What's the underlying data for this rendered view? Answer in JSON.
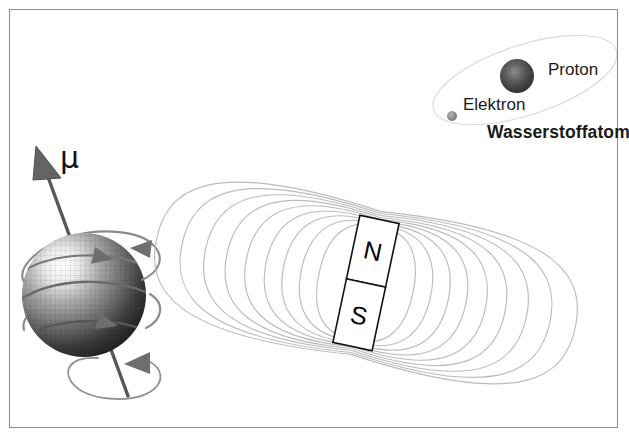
{
  "figure": {
    "background_color": "#ffffff",
    "border_color": "#8c8c8c",
    "width": 629,
    "height": 439
  },
  "hydrogen_atom": {
    "title": "Wasserstoffatom",
    "proton_label": "Proton",
    "electron_label": "Elektron",
    "proton_color": "#4a4a4a",
    "electron_color": "#8f8f8f",
    "orbit_color": "#d8d8d8",
    "proton": {
      "cx": 517,
      "cy": 76,
      "r": 17
    },
    "electron": {
      "cx": 452,
      "cy": 116,
      "r": 5
    },
    "orbit": {
      "cx": 525,
      "cy": 80,
      "rx": 95,
      "ry": 34,
      "rotation": -18
    }
  },
  "magnetic_moment": {
    "symbol": "μ",
    "sphere_color_light": "#ffffff",
    "sphere_color_dark": "#2b2b2b",
    "axis_color": "#5a5a5a",
    "spin_arrow_color": "#707070",
    "sphere": {
      "cx": 84,
      "cy": 295,
      "r": 62
    },
    "axis": {
      "x1": 42,
      "y1": 160,
      "x2": 128,
      "y2": 395
    },
    "precession_ellipse": {
      "cx": 113,
      "cy": 375,
      "rx": 48,
      "ry": 20,
      "rotation": -9
    }
  },
  "bar_magnet": {
    "north_label": "N",
    "south_label": "S",
    "body_fill": "#ffffff",
    "body_stroke": "#111111",
    "field_line_color": "#b9b9b9",
    "tilt_degrees": 12,
    "center": {
      "x": 366,
      "y": 283
    },
    "size": {
      "width": 40,
      "height": 130
    },
    "field_line_count": 9
  }
}
